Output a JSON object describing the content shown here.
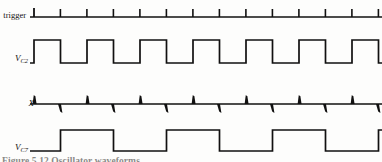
{
  "figure": {
    "caption": "Figure 5.12  Oscillator waveforms",
    "background_color": "#fdfdfc",
    "trace_color": "#111010"
  },
  "traces": [
    {
      "id": "trigger",
      "label": "trigger",
      "label_sub": "",
      "kind": "pulse-train",
      "baseline_y": 17,
      "start_x": 30,
      "end_x": 382,
      "pulse_count": 13,
      "pulse_spacing": 26.5,
      "pulse_height": 9,
      "first_pulse_x": 34
    },
    {
      "id": "vc2",
      "label": "V",
      "label_sub": "C2",
      "kind": "square-wave",
      "low_y": 63,
      "high_y": 40,
      "start_x": 30,
      "end_x": 382,
      "period": 53,
      "duty": 0.5,
      "first_rise_x": 34,
      "cycles": 6.6
    },
    {
      "id": "x",
      "label": "X",
      "label_sub": "",
      "kind": "differentiated-spikes",
      "baseline_y": 104,
      "start_x": 30,
      "end_x": 382,
      "spacing": 26.5,
      "up_height": 9,
      "down_height": 9,
      "first_spike_x": 34,
      "first_spike_dir": "up"
    },
    {
      "id": "vc7",
      "label": "V",
      "label_sub": "C7",
      "kind": "square-wave",
      "low_y": 151,
      "high_y": 130,
      "start_x": 30,
      "end_x": 382,
      "period": 106,
      "duty": 0.5,
      "first_rise_x": 60,
      "cycles": 3.3
    }
  ]
}
